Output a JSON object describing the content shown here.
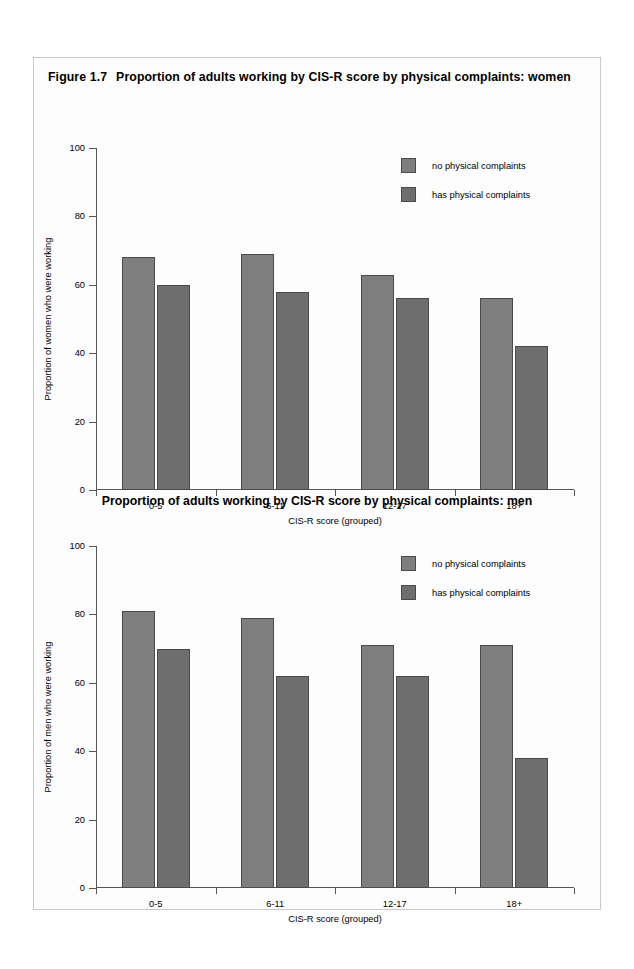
{
  "figure": {
    "number": "Figure 1.7",
    "title": "Proportion of adults working by CIS-R score by physical complaints: women"
  },
  "colors": {
    "series_no": "#7f7f7f",
    "series_has": "#6e6e6e",
    "bar_border": "#4a4a4a",
    "axis": "#555555",
    "card_border": "#c9c9c9",
    "background": "#fdfdfd"
  },
  "legend": {
    "items": [
      {
        "label": "no physical complaints",
        "color": "#7f7f7f"
      },
      {
        "label": "has physical complaints",
        "color": "#6e6e6e"
      }
    ]
  },
  "chart_data": [
    {
      "type": "bar",
      "id": "women",
      "title": "Proportion of adults working by CIS-R score by physical complaints: women",
      "figure_number": "Figure 1.7",
      "categories": [
        "0-5",
        "6-11",
        "12-17",
        "18+"
      ],
      "series": [
        {
          "name": "no physical complaints",
          "values": [
            68,
            69,
            63,
            56
          ],
          "color": "#7f7f7f"
        },
        {
          "name": "has physical complaints",
          "values": [
            60,
            58,
            56,
            42
          ],
          "color": "#6e6e6e"
        }
      ],
      "xlabel": "CIS-R score (grouped)",
      "ylabel": "Proportion of women who were working",
      "ylim": [
        0,
        100
      ],
      "yticks": [
        0,
        20,
        40,
        60,
        80,
        100
      ],
      "grid": false,
      "legend_position": "top-right"
    },
    {
      "type": "bar",
      "id": "men",
      "title": "Proportion of adults working by CIS-R score by physical complaints: men",
      "categories": [
        "0-5",
        "6-11",
        "12-17",
        "18+"
      ],
      "series": [
        {
          "name": "no physical complaints",
          "values": [
            81,
            79,
            71,
            71
          ],
          "color": "#7f7f7f"
        },
        {
          "name": "has physical complaints",
          "values": [
            70,
            62,
            62,
            38
          ],
          "color": "#6e6e6e"
        }
      ],
      "xlabel": "CIS-R score (grouped)",
      "ylabel": "Proportion of men who were working",
      "ylim": [
        0,
        100
      ],
      "yticks": [
        0,
        20,
        40,
        60,
        80,
        100
      ],
      "grid": false,
      "legend_position": "top-right"
    }
  ]
}
